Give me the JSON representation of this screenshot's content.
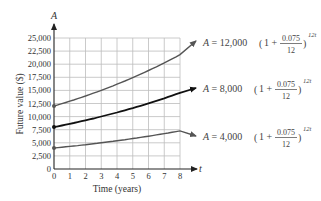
{
  "chart_data": {
    "type": "line",
    "title": "",
    "xlabel": "Time (years)",
    "ylabel": "Future value ($)",
    "x_axis_var": "t",
    "y_axis_var": "A",
    "xlim": [
      0,
      8
    ],
    "ylim": [
      0,
      25000
    ],
    "grid": true,
    "x_ticks": [
      "0",
      "1",
      "2",
      "3",
      "4",
      "5",
      "6",
      "7",
      "8"
    ],
    "y_ticks": [
      "0",
      "2,500",
      "5,000",
      "7,500",
      "10,000",
      "12,500",
      "15,000",
      "17,500",
      "20,000",
      "22,500",
      "25,000"
    ],
    "x": [
      0,
      1,
      2,
      3,
      4,
      5,
      6,
      7,
      8
    ],
    "series": [
      {
        "name": "A = 12,000(1 + 0.075/12)^12t",
        "principal": "12,000",
        "color": "#555555",
        "values": [
          12000,
          12931,
          13934,
          15016,
          16181,
          17436,
          18789,
          20247,
          21817
        ],
        "arrow_end": [
          9,
          23510
        ]
      },
      {
        "name": "A = 8,000(1 + 0.075/12)^12t",
        "principal": "8,000",
        "color": "#111111",
        "values": [
          8000,
          8621,
          9290,
          10011,
          10787,
          11624,
          12526,
          13498,
          14545
        ],
        "arrow_end": [
          9,
          15673
        ]
      },
      {
        "name": "A = 4,000(1 + 0.075/12)^12t",
        "principal": "4,000",
        "color": "#555555",
        "values": [
          4000,
          4310,
          4645,
          5005,
          5394,
          5812,
          6263,
          6749,
          7272
        ],
        "arrow_end": [
          9,
          7836
        ]
      }
    ],
    "legend_position": "right (inline annotations)",
    "equation_parts": {
      "lhs": "A =",
      "one_plus": "(1 +",
      "numerator": "0.075",
      "denominator": "12",
      "close": ")",
      "exponent": "12t"
    }
  }
}
